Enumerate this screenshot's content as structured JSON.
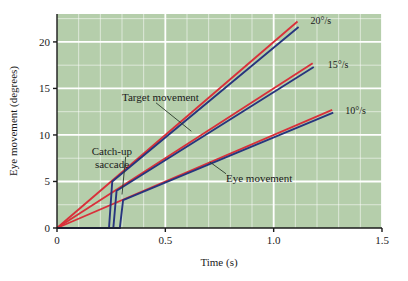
{
  "chart_data": {
    "type": "line",
    "title": "",
    "xlabel": "Time (s)",
    "ylabel": "Eye movement (degrees)",
    "xlim": [
      0,
      1.5
    ],
    "ylim": [
      0,
      23
    ],
    "xticks": [
      "0",
      "0.5",
      "1.0",
      "1.5"
    ],
    "xtick_values": [
      0,
      0.5,
      1.0,
      1.5
    ],
    "yticks": [
      "0",
      "5",
      "10",
      "15",
      "20"
    ],
    "ytick_values": [
      0,
      5,
      10,
      15,
      20
    ],
    "grid": true,
    "grid_color": "#ffffff",
    "plot_bg": "#b5ceab",
    "legend_position": "inline-annotations",
    "series": [
      {
        "name": "Target movement 20 deg/s",
        "role": "target",
        "color": "#d9303a",
        "slope_deg_per_s": 20,
        "points": [
          [
            0,
            0
          ],
          [
            1.11,
            22.2
          ]
        ]
      },
      {
        "name": "Target movement 15 deg/s",
        "role": "target",
        "color": "#d9303a",
        "slope_deg_per_s": 15,
        "points": [
          [
            0,
            0
          ],
          [
            1.18,
            17.7
          ]
        ]
      },
      {
        "name": "Target movement 10 deg/s",
        "role": "target",
        "color": "#d9303a",
        "slope_deg_per_s": 10,
        "points": [
          [
            0,
            0
          ],
          [
            1.27,
            12.7
          ]
        ]
      },
      {
        "name": "Eye movement 20 deg/s",
        "role": "eye",
        "color": "#27357e",
        "slope_deg_per_s": 20,
        "latency_s": 0.24,
        "saccade_to_deg": 5.0,
        "points": [
          [
            0,
            0
          ],
          [
            0.24,
            0
          ],
          [
            0.255,
            5.0
          ],
          [
            1.115,
            21.6
          ]
        ]
      },
      {
        "name": "Eye movement 15 deg/s",
        "role": "eye",
        "color": "#27357e",
        "slope_deg_per_s": 15,
        "latency_s": 0.26,
        "saccade_to_deg": 4.0,
        "points": [
          [
            0,
            0
          ],
          [
            0.26,
            0
          ],
          [
            0.275,
            4.0
          ],
          [
            1.185,
            17.3
          ]
        ]
      },
      {
        "name": "Eye movement 10 deg/s",
        "role": "eye",
        "color": "#27357e",
        "slope_deg_per_s": 10,
        "latency_s": 0.29,
        "saccade_to_deg": 3.0,
        "points": [
          [
            0,
            0
          ],
          [
            0.29,
            0
          ],
          [
            0.305,
            3.0
          ],
          [
            1.275,
            12.4
          ]
        ]
      }
    ],
    "speed_labels": [
      {
        "text": "20°/s",
        "x": 1.17,
        "y": 22.4
      },
      {
        "text": "15°/s",
        "x": 1.25,
        "y": 17.6
      },
      {
        "text": "10°/s",
        "x": 1.33,
        "y": 12.7
      }
    ],
    "annotations": [
      {
        "text": "Target movement",
        "x": 0.3,
        "y": 14.1,
        "leader_to_x": 0.62,
        "leader_to_y": 10.4
      },
      {
        "text": "Catch-up",
        "x": 0.16,
        "y": 8.3,
        "leader_to_x": 0.3,
        "leader_to_y": 3.6
      },
      {
        "text": "saccade",
        "x": 0.175,
        "y": 6.9
      },
      {
        "text": "Eye movement",
        "x": 0.78,
        "y": 5.4,
        "leader_to_x": 0.705,
        "leader_to_y": 7.1
      }
    ]
  },
  "colors": {
    "target_red": "#d9303a",
    "eye_blue": "#27357e",
    "plot_background": "#b5ceab",
    "gridline": "#ffffff",
    "page_background": "#ffffff",
    "text": "#1a1a1a"
  }
}
